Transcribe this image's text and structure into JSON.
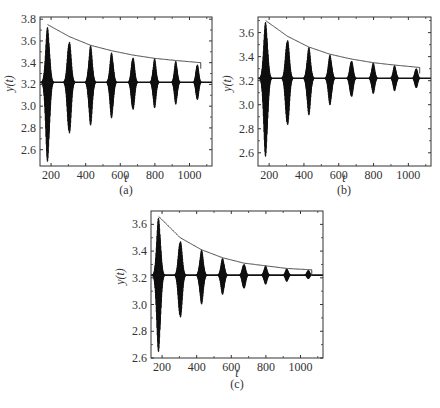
{
  "chart_data": [
    {
      "type": "line",
      "panel": "(a)",
      "caption": "(a)",
      "title": "",
      "xlabel": "t",
      "ylabel": "y(t)",
      "xlim": [
        136,
        1130
      ],
      "ylim": [
        2.45,
        3.82
      ],
      "xticks": [
        200,
        400,
        600,
        800,
        1000
      ],
      "yticks": [
        2.6,
        2.8,
        3.0,
        3.2,
        3.4,
        3.6,
        3.8
      ],
      "baseline": 3.22,
      "burst_centers": [
        180,
        305,
        428,
        550,
        673,
        798,
        921,
        1045
      ],
      "burst_max": [
        3.74,
        3.63,
        3.56,
        3.5,
        3.47,
        3.44,
        3.42,
        3.4
      ],
      "burst_min": [
        2.47,
        2.7,
        2.82,
        2.88,
        2.94,
        2.98,
        3.01,
        3.04
      ],
      "envelope": {
        "x": [
          180,
          305,
          428,
          550,
          673,
          798,
          921,
          1065
        ],
        "y": [
          3.75,
          3.64,
          3.56,
          3.51,
          3.47,
          3.44,
          3.42,
          3.4
        ]
      }
    },
    {
      "type": "line",
      "panel": "(b)",
      "caption": "(b)",
      "title": "",
      "xlabel": "t",
      "ylabel": "y(t)",
      "xlim": [
        136,
        1130
      ],
      "ylim": [
        2.49,
        3.73
      ],
      "xticks": [
        200,
        400,
        600,
        800,
        1000
      ],
      "yticks": [
        2.6,
        2.8,
        3.0,
        3.2,
        3.4,
        3.6
      ],
      "baseline": 3.22,
      "burst_centers": [
        180,
        305,
        428,
        550,
        673,
        798,
        921,
        1045
      ],
      "burst_max": [
        3.7,
        3.57,
        3.48,
        3.42,
        3.38,
        3.35,
        3.33,
        3.31
      ],
      "burst_min": [
        2.55,
        2.79,
        2.91,
        2.99,
        3.05,
        3.09,
        3.11,
        3.13
      ],
      "envelope": {
        "x": [
          180,
          305,
          428,
          550,
          673,
          798,
          921,
          1065
        ],
        "y": [
          3.7,
          3.57,
          3.48,
          3.42,
          3.38,
          3.35,
          3.33,
          3.31
        ]
      }
    },
    {
      "type": "line",
      "panel": "(c)",
      "caption": "(c)",
      "title": "",
      "xlabel": "t",
      "ylabel": "y(t)",
      "xlim": [
        136,
        1130
      ],
      "ylim": [
        2.6,
        3.7
      ],
      "xticks": [
        200,
        400,
        600,
        800,
        1000
      ],
      "yticks": [
        2.6,
        2.8,
        3.0,
        3.2,
        3.4,
        3.6
      ],
      "baseline": 3.22,
      "burst_centers": [
        180,
        305,
        428,
        550,
        673,
        798,
        921,
        1045
      ],
      "burst_max": [
        3.66,
        3.5,
        3.41,
        3.35,
        3.31,
        3.29,
        3.27,
        3.26
      ],
      "burst_min": [
        2.63,
        2.87,
        3.0,
        3.07,
        3.11,
        3.15,
        3.17,
        3.19
      ],
      "envelope": {
        "x": [
          180,
          305,
          428,
          550,
          673,
          798,
          921,
          1065
        ],
        "y": [
          3.66,
          3.5,
          3.41,
          3.35,
          3.31,
          3.29,
          3.27,
          3.26
        ]
      }
    }
  ],
  "panels": {
    "a": {
      "caption": "(a)",
      "xlabel": "t",
      "ylabel": "y(t)"
    },
    "b": {
      "caption": "(b)",
      "xlabel": "t",
      "ylabel": "y(t)"
    },
    "c": {
      "caption": "(c)",
      "xlabel": "t",
      "ylabel": "y(t)"
    }
  }
}
